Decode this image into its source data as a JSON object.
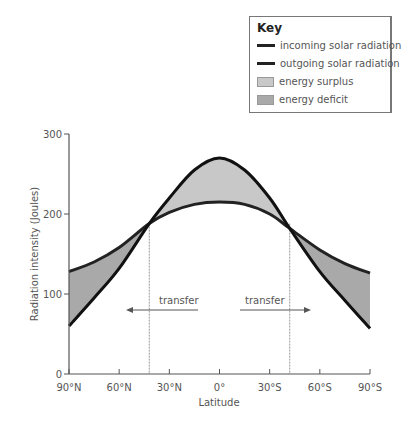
{
  "key": {
    "title": "Key",
    "items": [
      {
        "label": "incoming solar radiation",
        "type": "line",
        "color": "#222222"
      },
      {
        "label": "outgoing solar radiation",
        "type": "line",
        "color": "#333333"
      },
      {
        "label": "energy surplus",
        "type": "fill",
        "color": "#c8c8c8"
      },
      {
        "label": "energy deficit",
        "type": "fill",
        "color": "#a9a9a9"
      }
    ]
  },
  "annotations": {
    "left_arrow_label": "transfer",
    "right_arrow_label": "transfer"
  },
  "chart_data": {
    "type": "line",
    "title": "",
    "xlabel": "Latitude",
    "ylabel": "Radiation intensity (Joules)",
    "ylim": [
      0,
      300
    ],
    "yticks": [
      0,
      100,
      200,
      300
    ],
    "x_tick_labels": [
      "90°N",
      "60°N",
      "30°N",
      "0°",
      "30°S",
      "60°S",
      "90°S"
    ],
    "x": [
      -90,
      -75,
      -60,
      -42,
      -30,
      -15,
      0,
      15,
      30,
      42,
      60,
      75,
      90
    ],
    "series": [
      {
        "name": "incoming solar radiation",
        "values": [
          60,
          95,
          132,
          188,
          220,
          255,
          270,
          255,
          220,
          182,
          128,
          92,
          57
        ]
      },
      {
        "name": "outgoing solar radiation",
        "values": [
          128,
          140,
          158,
          188,
          202,
          212,
          215,
          212,
          200,
          182,
          155,
          138,
          126
        ]
      }
    ],
    "regions": [
      {
        "name": "energy surplus",
        "from": "42°N",
        "to": "42°S"
      },
      {
        "name": "energy deficit",
        "from": "90°N",
        "to": "42°N"
      },
      {
        "name": "energy deficit",
        "from": "42°S",
        "to": "90°S"
      }
    ],
    "crossover_latitudes": [
      "~42°N",
      "~42°S"
    ],
    "grid": false,
    "legend_position": "top-right"
  }
}
